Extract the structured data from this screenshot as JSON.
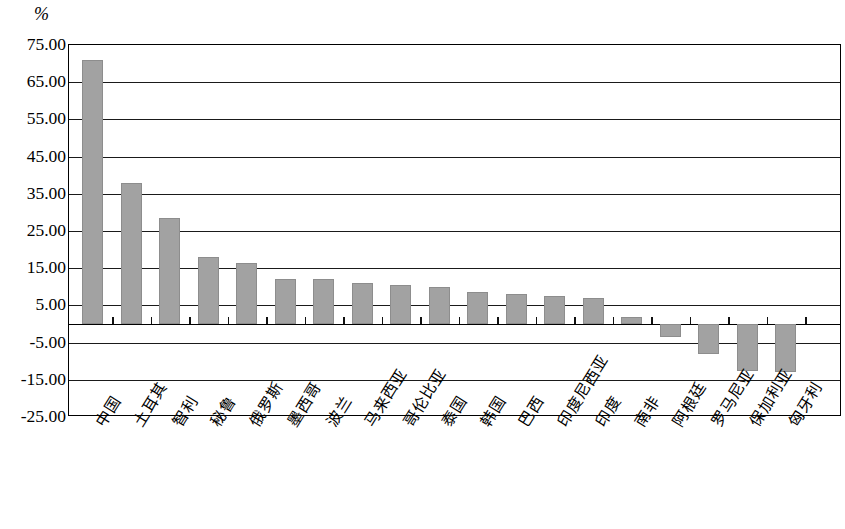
{
  "chart_data": {
    "type": "bar",
    "title": "",
    "subtitle": "",
    "xlabel": "",
    "ylabel": "%",
    "unit_label": "%",
    "ylim": [
      -25.0,
      75.0
    ],
    "ytick_step": 10.0,
    "grid": true,
    "legend": false,
    "bar_color": "#a2a2a2",
    "axis_color": "#000000",
    "ytick_labels": [
      "75.00",
      "65.00",
      "55.00",
      "45.00",
      "35.00",
      "25.00",
      "15.00",
      "5.00",
      "-5.00",
      "-15.00",
      "-25.00"
    ],
    "ytick_values": [
      75.0,
      65.0,
      55.0,
      45.0,
      35.0,
      25.0,
      15.0,
      5.0,
      -5.0,
      -15.0,
      -25.0
    ],
    "categories": [
      "中国",
      "土耳其",
      "智利",
      "秘鲁",
      "俄罗斯",
      "墨西哥",
      "波兰",
      "马来西亚",
      "哥伦比亚",
      "泰国",
      "韩国",
      "巴西",
      "印度尼西亚",
      "印度",
      "南非",
      "阿根廷",
      "罗马尼亚",
      "保加利亚",
      "匈牙利"
    ],
    "values": [
      71.0,
      38.0,
      28.5,
      18.0,
      16.5,
      12.0,
      12.0,
      11.0,
      10.5,
      10.0,
      8.5,
      8.0,
      7.5,
      7.0,
      2.0,
      -3.5,
      -8.0,
      -12.5,
      -13.0
    ]
  }
}
